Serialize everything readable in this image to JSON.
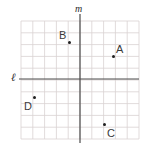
{
  "figure": {
    "background_color": "#ffffff",
    "grid": {
      "color": "#d9d2d2",
      "left": 21,
      "top": 21,
      "right": 139,
      "bottom": 139,
      "columns": 10,
      "rows": 10,
      "cell_size": 11.8,
      "line_width": 0.8
    },
    "axes": {
      "color": "#4a4a4a",
      "line_width": 1.2,
      "vertical": {
        "name": "m",
        "label": "m",
        "x": 80,
        "y_top": 14,
        "y_bottom": 143
      },
      "horizontal": {
        "name": "l",
        "label": "ℓ",
        "y": 79,
        "x_left": 19,
        "x_right": 139
      }
    },
    "points": [
      {
        "id": "A",
        "label": "A",
        "dot_x": 113,
        "dot_y": 56,
        "label_x": 116,
        "label_y": 44
      },
      {
        "id": "B",
        "label": "B",
        "dot_x": 69,
        "dot_y": 42,
        "label_x": 59,
        "label_y": 30
      },
      {
        "id": "C",
        "label": "C",
        "dot_x": 104,
        "dot_y": 124,
        "label_x": 107,
        "label_y": 128
      },
      {
        "id": "D",
        "label": "D",
        "dot_x": 34,
        "dot_y": 97,
        "label_x": 24,
        "label_y": 101
      }
    ]
  }
}
